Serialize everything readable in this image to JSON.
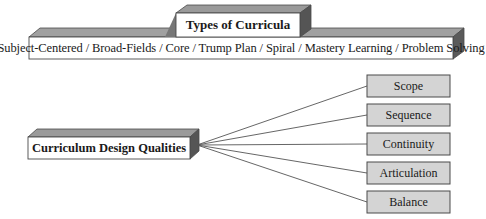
{
  "diagram": {
    "types_box": {
      "title": "Types of Curricula"
    },
    "types_list": {
      "text": "Subject-Centered / Broad-Fields / Core / Trump Plan / Spiral / Mastery Learning / Problem Solving",
      "items": [
        "Subject-Centered",
        "Broad-Fields",
        "Core",
        "Trump Plan",
        "Spiral",
        "Mastery Learning",
        "Problem Solving"
      ]
    },
    "qualities_hub": {
      "title": "Curriculum Design Qualities"
    },
    "qualities": [
      {
        "label": "Scope"
      },
      {
        "label": "Sequence"
      },
      {
        "label": "Continuity"
      },
      {
        "label": "Articulation"
      },
      {
        "label": "Balance"
      }
    ],
    "colors": {
      "box_front": "#ffffff",
      "box_top": "#9a9a9a",
      "box_side": "#555555",
      "quality_fill": "#d4d4d4",
      "border": "#4a4a4a",
      "connector": "#555555"
    }
  }
}
